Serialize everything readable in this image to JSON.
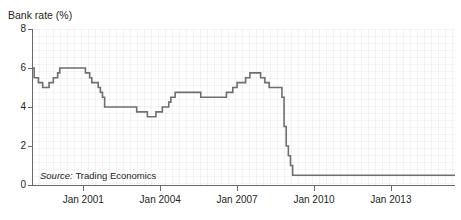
{
  "chart_data": {
    "type": "line",
    "title": "Bank rate (%)",
    "xlabel": "",
    "ylabel": "Bank rate (%)",
    "ylim": [
      0,
      8
    ],
    "yticks": [
      0,
      2,
      4,
      6,
      8
    ],
    "ytick_labels": [
      "0",
      "2",
      "4",
      "6",
      "8"
    ],
    "xlim": [
      "1999-01",
      "2015-07"
    ],
    "xticks": [
      "2001-01",
      "2004-01",
      "2007-01",
      "2010-01",
      "2013-01"
    ],
    "xtick_labels": [
      "Jan 2001",
      "Jan 2004",
      "Jan 2007",
      "Jan 2010",
      "Jan 2013"
    ],
    "grid": true,
    "legend": null,
    "line_color": "#6e6e6e",
    "step_style": "post",
    "annotations": [
      {
        "text": "Source: Trading Economics",
        "x": "2000-06",
        "y": 1.0
      }
    ],
    "series": [
      {
        "name": "Bank rate (%)",
        "points": [
          {
            "x": "1999-01",
            "y": 6.0
          },
          {
            "x": "1999-02",
            "y": 5.5
          },
          {
            "x": "1999-04",
            "y": 5.25
          },
          {
            "x": "1999-06",
            "y": 5.0
          },
          {
            "x": "1999-09",
            "y": 5.25
          },
          {
            "x": "1999-11",
            "y": 5.5
          },
          {
            "x": "2000-01",
            "y": 5.75
          },
          {
            "x": "2000-02",
            "y": 6.0
          },
          {
            "x": "2001-02",
            "y": 5.75
          },
          {
            "x": "2001-04",
            "y": 5.5
          },
          {
            "x": "2001-05",
            "y": 5.25
          },
          {
            "x": "2001-08",
            "y": 5.0
          },
          {
            "x": "2001-09",
            "y": 4.75
          },
          {
            "x": "2001-10",
            "y": 4.5
          },
          {
            "x": "2001-11",
            "y": 4.0
          },
          {
            "x": "2003-02",
            "y": 3.75
          },
          {
            "x": "2003-07",
            "y": 3.5
          },
          {
            "x": "2003-11",
            "y": 3.75
          },
          {
            "x": "2004-02",
            "y": 4.0
          },
          {
            "x": "2004-05",
            "y": 4.25
          },
          {
            "x": "2004-06",
            "y": 4.5
          },
          {
            "x": "2004-08",
            "y": 4.75
          },
          {
            "x": "2005-08",
            "y": 4.5
          },
          {
            "x": "2006-08",
            "y": 4.75
          },
          {
            "x": "2006-11",
            "y": 5.0
          },
          {
            "x": "2007-01",
            "y": 5.25
          },
          {
            "x": "2007-05",
            "y": 5.5
          },
          {
            "x": "2007-07",
            "y": 5.75
          },
          {
            "x": "2007-12",
            "y": 5.5
          },
          {
            "x": "2008-02",
            "y": 5.25
          },
          {
            "x": "2008-04",
            "y": 5.0
          },
          {
            "x": "2008-10",
            "y": 4.5
          },
          {
            "x": "2008-11",
            "y": 3.0
          },
          {
            "x": "2008-12",
            "y": 2.0
          },
          {
            "x": "2009-01",
            "y": 1.5
          },
          {
            "x": "2009-02",
            "y": 1.0
          },
          {
            "x": "2009-03",
            "y": 0.5
          },
          {
            "x": "2015-07",
            "y": 0.5
          }
        ]
      }
    ]
  },
  "source": {
    "label_prefix": "Source:",
    "label_value": "Trading Economics"
  }
}
